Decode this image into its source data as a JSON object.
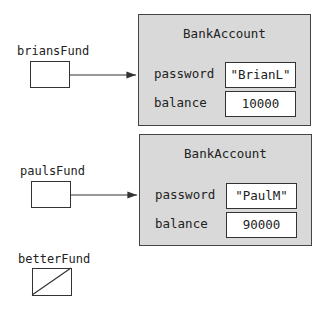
{
  "variables": [
    {
      "name": "briansFund",
      "points_to": 0
    },
    {
      "name": "paulsFund",
      "points_to": 1
    },
    {
      "name": "betterFund",
      "points_to": null,
      "null_marker": "diagonal-slash"
    }
  ],
  "objects": [
    {
      "class_name": "BankAccount",
      "fields": [
        {
          "label": "password",
          "value": "\"BrianL\""
        },
        {
          "label": "balance",
          "value": "10000"
        }
      ]
    },
    {
      "class_name": "BankAccount",
      "fields": [
        {
          "label": "password",
          "value": "\"PaulM\""
        },
        {
          "label": "balance",
          "value": "90000"
        }
      ]
    }
  ],
  "colors": {
    "object_fill": "#d9d9d9",
    "stroke": "#333333",
    "background": "#ffffff"
  }
}
